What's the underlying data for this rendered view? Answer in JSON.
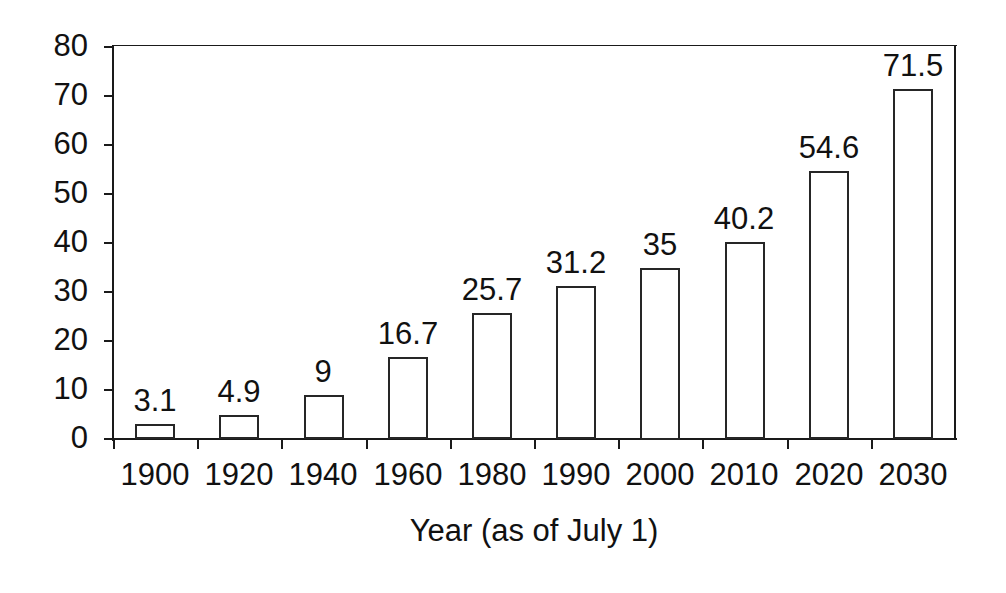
{
  "chart_data": {
    "type": "bar",
    "title": "",
    "subtitle": "",
    "xlabel": "Year (as of July 1)",
    "ylabel": "",
    "categories": [
      "1900",
      "1920",
      "1940",
      "1960",
      "1980",
      "1990",
      "2000",
      "2010",
      "2020",
      "2030"
    ],
    "values": [
      3.1,
      4.9,
      9,
      16.7,
      25.7,
      31.2,
      35,
      40.2,
      54.6,
      71.5
    ],
    "value_labels": [
      "3.1",
      "4.9",
      "9",
      "16.7",
      "25.7",
      "31.2",
      "35",
      "40.2",
      "54.6",
      "71.5"
    ],
    "ylim": [
      0,
      80
    ],
    "ytick_values": [
      0,
      10,
      20,
      30,
      40,
      50,
      60,
      70,
      80
    ],
    "ytick_labels": [
      "0",
      "10",
      "20",
      "30",
      "40",
      "50",
      "60",
      "70",
      "80"
    ],
    "grid": false,
    "legend": null,
    "series": [
      {
        "name": "",
        "values": [
          3.1,
          4.9,
          9,
          16.7,
          25.7,
          31.2,
          35,
          40.2,
          54.6,
          71.5
        ]
      }
    ],
    "style": {
      "bar_fill": "#ffffff",
      "bar_stroke": "#262626",
      "axis_color": "#1a1a1a",
      "text_color": "#111111",
      "background": "#ffffff"
    }
  }
}
